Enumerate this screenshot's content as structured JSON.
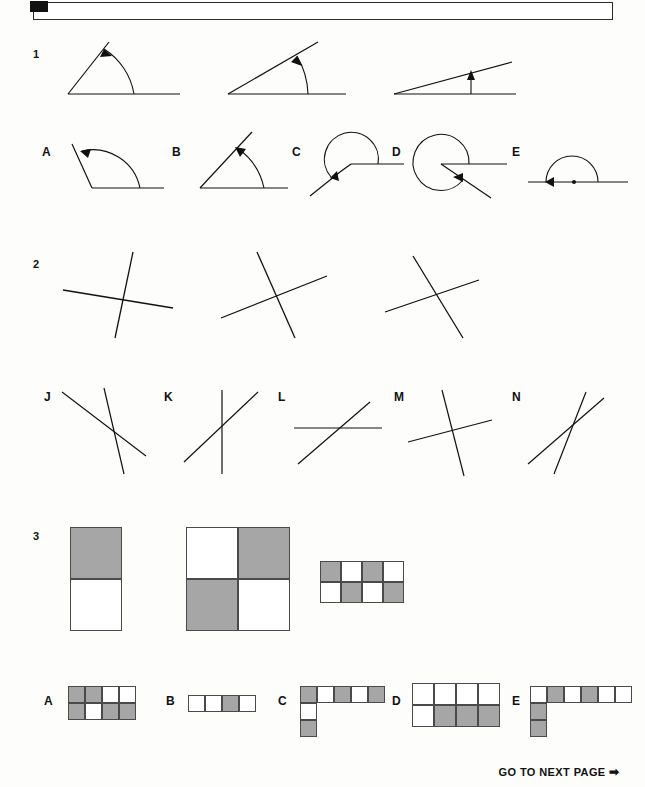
{
  "page": {
    "footer_text": "GO TO NEXT PAGE",
    "footer_arrow": "➡",
    "paper_color": "#fdfdfb",
    "ink_color": "#111111",
    "shade_color": "#a6a6a6"
  },
  "questions": [
    {
      "number": "1",
      "type": "angle-sequence",
      "prompt_figures": [
        {
          "name": "angle-60",
          "angle_deg": 62,
          "arc": "interior",
          "arrow": "at-ray-end"
        },
        {
          "name": "angle-40",
          "angle_deg": 41,
          "arc": "interior",
          "arrow": "at-ray-end"
        },
        {
          "name": "angle-15",
          "angle_deg": 15,
          "arc": "interior",
          "arrow": "at-ray-end"
        }
      ],
      "options": [
        {
          "letter": "A",
          "name": "option-a-obtuse-angle",
          "angle_deg": 118,
          "arc": "interior"
        },
        {
          "letter": "B",
          "name": "option-b-acute-angle",
          "angle_deg": 68,
          "arc": "interior"
        },
        {
          "letter": "C",
          "name": "option-c-reflex-angle",
          "angle_deg": 228,
          "arc": "reflex"
        },
        {
          "letter": "D",
          "name": "option-d-reflex-angle",
          "angle_deg": 320,
          "arc": "reflex"
        },
        {
          "letter": "E",
          "name": "option-e-straight-angle",
          "angle_deg": 180,
          "arc": "reflex"
        }
      ]
    },
    {
      "number": "2",
      "type": "crossed-lines-sequence",
      "prompt_figures": [
        {
          "name": "crossed-lines-1",
          "line_angles_deg": [
            80,
            8
          ]
        },
        {
          "name": "crossed-lines-2",
          "line_angles_deg": [
            72,
            24
          ]
        },
        {
          "name": "crossed-lines-3",
          "line_angles_deg": [
            64,
            30
          ]
        }
      ],
      "options": [
        {
          "letter": "J",
          "name": "option-j-crossed-lines",
          "line_angles_deg": [
            72,
            26
          ]
        },
        {
          "letter": "K",
          "name": "option-k-crossed-lines",
          "line_angles_deg": [
            90,
            45
          ]
        },
        {
          "letter": "L",
          "name": "option-l-crossed-lines",
          "line_angles_deg": [
            0,
            38
          ]
        },
        {
          "letter": "M",
          "name": "option-m-crossed-lines",
          "line_angles_deg": [
            76,
            20
          ]
        },
        {
          "letter": "N",
          "name": "option-n-crossed-lines",
          "line_angles_deg": [
            66,
            36
          ]
        }
      ]
    },
    {
      "number": "3",
      "type": "shaded-grid-sequence",
      "prompt_figures": [
        {
          "name": "grid-1x2-checker",
          "cols": 1,
          "rows": 2,
          "cell_px": 52,
          "cells": [
            [
              "g"
            ],
            [
              "w"
            ]
          ]
        },
        {
          "name": "grid-2x2-checker",
          "cols": 2,
          "rows": 2,
          "cell_px": 52,
          "cells": [
            [
              "w",
              "g"
            ],
            [
              "g",
              "w"
            ]
          ]
        },
        {
          "name": "grid-4x2-checker",
          "cols": 4,
          "rows": 2,
          "cell_px": 21,
          "cells": [
            [
              "g",
              "w",
              "g",
              "w"
            ],
            [
              "w",
              "g",
              "w",
              "g"
            ]
          ]
        }
      ],
      "options": [
        {
          "letter": "A",
          "name": "option-a-grid",
          "cols": 4,
          "rows": 2,
          "cell_px": 17,
          "cells": [
            [
              "g",
              "g",
              "w",
              "w"
            ],
            [
              "g",
              "w",
              "g",
              "g"
            ]
          ]
        },
        {
          "letter": "B",
          "name": "option-b-grid",
          "cols": 4,
          "rows": 1,
          "cell_px": 17,
          "cells": [
            [
              "w",
              "w",
              "g",
              "w"
            ]
          ]
        },
        {
          "letter": "C",
          "name": "option-c-grid",
          "cols": 5,
          "rows": 3,
          "cell_px": 17,
          "cells": [
            [
              "g",
              "w",
              "g",
              "w",
              "g"
            ],
            [
              "w",
              "x",
              "x",
              "x",
              "x"
            ],
            [
              "g",
              "x",
              "x",
              "x",
              "x"
            ]
          ]
        },
        {
          "letter": "D",
          "name": "option-d-grid",
          "cols": 4,
          "rows": 2,
          "cell_px": 22,
          "cells": [
            [
              "w",
              "w",
              "w",
              "w"
            ],
            [
              "w",
              "g",
              "g",
              "g"
            ]
          ]
        },
        {
          "letter": "E",
          "name": "option-e-grid",
          "cols": 6,
          "rows": 3,
          "cell_px": 17,
          "cells": [
            [
              "w",
              "g",
              "w",
              "g",
              "w",
              "w"
            ],
            [
              "g",
              "x",
              "x",
              "x",
              "x",
              "x"
            ],
            [
              "g",
              "x",
              "x",
              "x",
              "x",
              "x"
            ]
          ]
        }
      ]
    }
  ]
}
